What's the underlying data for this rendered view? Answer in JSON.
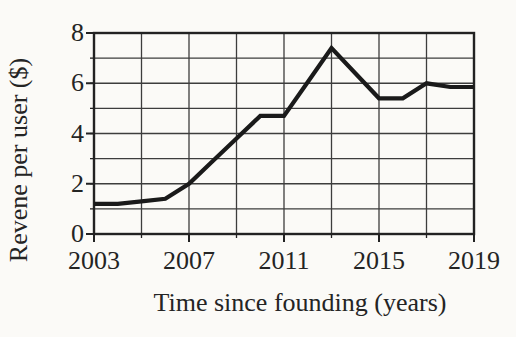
{
  "chart_data": {
    "type": "line",
    "title": "",
    "xlabel": "Time since founding (years)",
    "ylabel": "Revene per user ($)",
    "x": [
      2003,
      2004,
      2005,
      2006,
      2007,
      2008,
      2009,
      2010,
      2011,
      2012,
      2013,
      2014,
      2015,
      2016,
      2017,
      2018,
      2019
    ],
    "values": [
      1.2,
      1.2,
      1.3,
      1.4,
      2.0,
      2.9,
      3.8,
      4.7,
      4.7,
      6.05,
      7.4,
      6.4,
      5.4,
      5.4,
      6.0,
      5.85,
      5.85
    ],
    "series_name": "revenue-per-user",
    "xlim": [
      2003,
      2019
    ],
    "ylim": [
      0,
      8
    ],
    "xticks_labeled": [
      2003,
      2007,
      2011,
      2015,
      2019
    ],
    "yticks_labeled": [
      0,
      2,
      4,
      6,
      8
    ],
    "x_grid_step": 2,
    "y_grid_step": 1,
    "grid": true,
    "legend": "none",
    "colors": {
      "line": "#1a1a1a",
      "grid": "#3d3d3d",
      "axis": "#222222",
      "background": "#fbfaf7",
      "text": "#242424"
    }
  }
}
